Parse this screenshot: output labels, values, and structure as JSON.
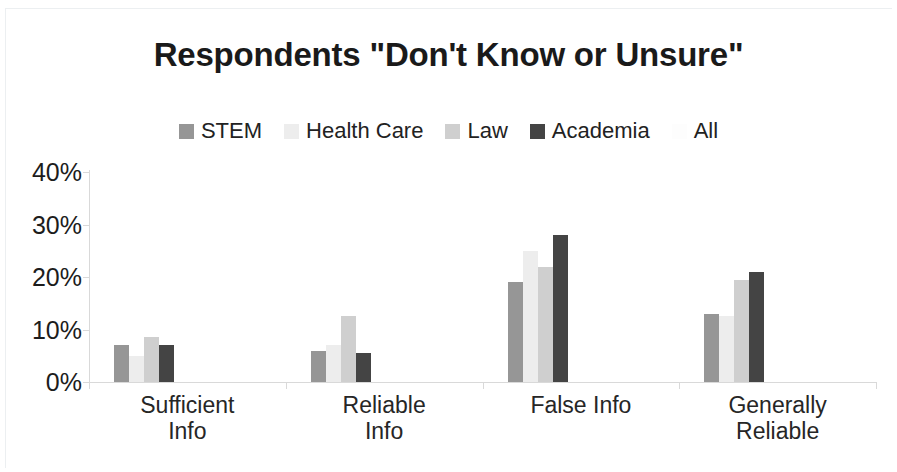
{
  "chart_data": {
    "type": "bar",
    "title": "Respondents \"Don't Know or Unsure\"",
    "xlabel": "",
    "ylabel": "",
    "grid": false,
    "legend_position": "top-center",
    "categories": [
      "Sufficient Info",
      "Reliable Info",
      "False Info",
      "Generally Reliable"
    ],
    "category_lines": [
      [
        "Sufficient",
        "Info"
      ],
      [
        "Reliable",
        "Info"
      ],
      [
        "False Info"
      ],
      [
        "Generally",
        "Reliable"
      ]
    ],
    "series": [
      {
        "name": "STEM",
        "color": "#969696",
        "values": [
          7,
          6,
          19,
          13
        ]
      },
      {
        "name": "Health Care",
        "color": "#ededed",
        "values": [
          5,
          7,
          25,
          12.5
        ]
      },
      {
        "name": "Law",
        "color": "#cfcfcf",
        "values": [
          8.5,
          12.5,
          22,
          19.5
        ]
      },
      {
        "name": "Academia",
        "color": "#444444",
        "values": [
          7,
          5.5,
          28,
          21
        ]
      },
      {
        "name": "All",
        "color": "#fdfdfd",
        "values": [
          null,
          null,
          null,
          null
        ]
      }
    ],
    "ylim": [
      0,
      40
    ],
    "ytick_values": [
      0,
      10,
      20,
      30,
      40
    ],
    "ytick_labels": [
      "0%",
      "10%",
      "20%",
      "30%",
      "40%"
    ],
    "value_suffix": "%"
  },
  "legend": {
    "entries": [
      {
        "label": "STEM"
      },
      {
        "label": "Health Care"
      },
      {
        "label": "Law"
      },
      {
        "label": "Academia"
      },
      {
        "label": "All"
      }
    ]
  }
}
